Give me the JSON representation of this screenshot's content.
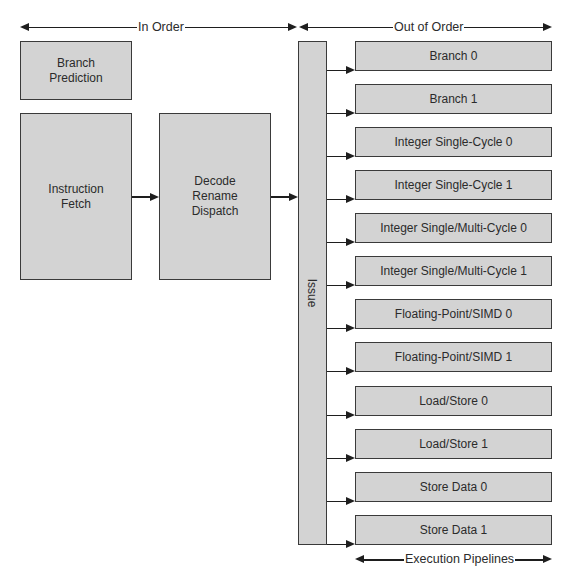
{
  "colors": {
    "box_fill": "#d3d3d3",
    "box_border": "#3a3a3a",
    "arrow": "#1e1e1e",
    "background": "#ffffff"
  },
  "spans": {
    "in_order": "In Order",
    "out_of_order": "Out of Order",
    "execution_pipelines": "Execution Pipelines"
  },
  "front_end": {
    "branch_prediction": "Branch\nPrediction",
    "instruction_fetch": "Instruction\nFetch",
    "decode_rename_dispatch": "Decode\nRename\nDispatch"
  },
  "issue": {
    "label": "Issue"
  },
  "pipelines": [
    {
      "label": "Branch 0"
    },
    {
      "label": "Branch 1"
    },
    {
      "label": "Integer Single-Cycle 0"
    },
    {
      "label": "Integer Single-Cycle 1"
    },
    {
      "label": "Integer Single/Multi-Cycle 0"
    },
    {
      "label": "Integer Single/Multi-Cycle 1"
    },
    {
      "label": "Floating-Point/SIMD 0"
    },
    {
      "label": "Floating-Point/SIMD 1"
    },
    {
      "label": "Load/Store 0"
    },
    {
      "label": "Load/Store 1"
    },
    {
      "label": "Store Data 0"
    },
    {
      "label": "Store Data 1"
    }
  ]
}
